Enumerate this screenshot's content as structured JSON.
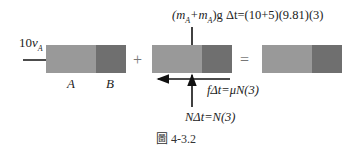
{
  "figure": {
    "caption": "圖 4-3.2",
    "colors": {
      "block_a": "#999999",
      "block_b": "#6f6f6f",
      "arrow": "#111111"
    },
    "blocks": [
      {
        "id": "initial",
        "labels": {
          "a": "A",
          "b": "B"
        }
      },
      {
        "id": "impulse"
      },
      {
        "id": "final"
      }
    ],
    "operators": {
      "plus": "+",
      "equals": "="
    },
    "annotations": {
      "initial_momentum": {
        "coef": "10",
        "var": "v",
        "sub": "A"
      },
      "weight_impulse": {
        "lhs_open": "(m",
        "sub1": "A",
        "plus": "+m",
        "sub2": "A",
        "rhs": ")g Δt=(10+5)(9.81)(3)"
      },
      "friction_impulse": "fΔt=μN(3)",
      "normal_impulse": "NΔt=N(3)"
    }
  }
}
